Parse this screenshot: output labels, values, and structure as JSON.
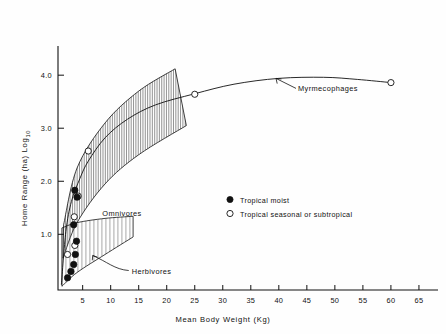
{
  "chart_data": {
    "type": "scatter",
    "title": "",
    "xlabel": "Mean Body Weight (Kg)",
    "ylabel": "Home Range (ha) Log10",
    "ylabel_base": "Home Range (ha) Log",
    "ylabel_sub": "10",
    "xlim": [
      0,
      68
    ],
    "ylim": [
      0,
      4.6
    ],
    "grid": false,
    "xticks": [
      5,
      10,
      15,
      20,
      25,
      30,
      35,
      40,
      45,
      50,
      55,
      60,
      65
    ],
    "xtick_labels": [
      "5",
      "10",
      "15",
      "20",
      "25",
      "30",
      "35",
      "40",
      "45",
      "50",
      "55",
      "60",
      "65"
    ],
    "yticks": [
      1.0,
      2.0,
      3.0,
      4.0
    ],
    "ytick_labels": [
      "1.0",
      "2.0",
      "3.0",
      "4.0"
    ],
    "legend_position": "center-right",
    "series": [
      {
        "name": "Tropical moist",
        "marker": "filled-circle",
        "points": [
          {
            "x": 2.3,
            "y": 0.18
          },
          {
            "x": 2.9,
            "y": 0.3
          },
          {
            "x": 3.4,
            "y": 0.43
          },
          {
            "x": 3.7,
            "y": 0.62
          },
          {
            "x": 3.9,
            "y": 0.87
          },
          {
            "x": 3.4,
            "y": 1.18
          },
          {
            "x": 4.0,
            "y": 1.7
          },
          {
            "x": 3.6,
            "y": 1.83
          }
        ]
      },
      {
        "name": "Tropical seasonal or subtropical",
        "marker": "open-circle",
        "points": [
          {
            "x": 2.3,
            "y": 0.62
          },
          {
            "x": 3.6,
            "y": 0.79
          },
          {
            "x": 3.5,
            "y": 1.33
          },
          {
            "x": 4.2,
            "y": 1.72
          },
          {
            "x": 6.0,
            "y": 2.57
          },
          {
            "x": 25.0,
            "y": 3.64
          },
          {
            "x": 60.0,
            "y": 3.86
          }
        ]
      }
    ],
    "fitted_curve": {
      "name": "Myrmecophage fitted curve",
      "points": [
        {
          "x": 1.2,
          "y": 0.05
        },
        {
          "x": 2.0,
          "y": 1.05
        },
        {
          "x": 3.0,
          "y": 1.62
        },
        {
          "x": 4.5,
          "y": 2.05
        },
        {
          "x": 6.0,
          "y": 2.38
        },
        {
          "x": 9.0,
          "y": 2.82
        },
        {
          "x": 13.0,
          "y": 3.17
        },
        {
          "x": 18.0,
          "y": 3.44
        },
        {
          "x": 25.0,
          "y": 3.65
        },
        {
          "x": 32.0,
          "y": 3.83
        },
        {
          "x": 40.0,
          "y": 3.94
        },
        {
          "x": 48.0,
          "y": 3.96
        },
        {
          "x": 54.0,
          "y": 3.92
        },
        {
          "x": 60.0,
          "y": 3.86
        }
      ]
    },
    "bands": [
      {
        "name": "Omnivores",
        "label": "Omnivores",
        "hatch": "vertical",
        "upper": [
          {
            "x": 1.6,
            "y": 1.18
          },
          {
            "x": 4.0,
            "y": 2.25
          },
          {
            "x": 9.0,
            "y": 3.1
          },
          {
            "x": 15.0,
            "y": 3.7
          },
          {
            "x": 21.5,
            "y": 4.12
          }
        ],
        "lower": [
          {
            "x": 1.5,
            "y": 0.55
          },
          {
            "x": 4.0,
            "y": 1.22
          },
          {
            "x": 9.0,
            "y": 1.95
          },
          {
            "x": 15.0,
            "y": 2.5
          },
          {
            "x": 23.5,
            "y": 3.05
          }
        ]
      },
      {
        "name": "Herbivores",
        "label": "Herbivores",
        "hatch": "vertical",
        "upper": [
          {
            "x": 1.3,
            "y": 1.12
          },
          {
            "x": 4.0,
            "y": 1.22
          },
          {
            "x": 9.0,
            "y": 1.3
          },
          {
            "x": 14.0,
            "y": 1.34
          }
        ],
        "lower": [
          {
            "x": 1.3,
            "y": 0.02
          },
          {
            "x": 4.0,
            "y": 0.28
          },
          {
            "x": 9.0,
            "y": 0.62
          },
          {
            "x": 14.0,
            "y": 0.95
          }
        ]
      }
    ],
    "annotations": [
      {
        "name": "myrmecophages",
        "text": "Myrmecophages",
        "target": {
          "x": 39.5,
          "y": 3.94
        }
      },
      {
        "name": "omnivores",
        "text": "Omnivores",
        "target": {
          "x": 8.5,
          "y": 1.35
        }
      },
      {
        "name": "herbivores",
        "text": "Herbivores",
        "target": {
          "x": 6.8,
          "y": 0.6
        }
      }
    ]
  },
  "legend": {
    "entries": [
      {
        "marker": "filled-circle",
        "label": "Tropical moist"
      },
      {
        "marker": "open-circle",
        "label": "Tropical seasonal or subtropical"
      }
    ]
  },
  "colors": {
    "axis": "#111111",
    "marker_fill": "#111111",
    "marker_open": "#ffffff",
    "hatch": "#3a3a3a",
    "background": "#fefefe"
  }
}
